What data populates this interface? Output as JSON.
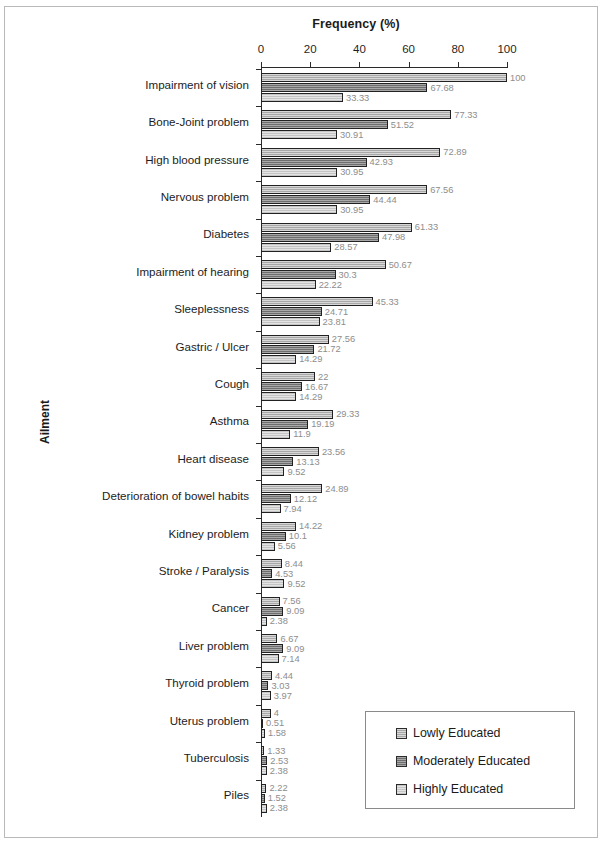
{
  "chart_data": {
    "type": "bar",
    "orientation": "horizontal",
    "title": "",
    "xlabel": "Frequency (%)",
    "ylabel": "Ailment",
    "xlim": [
      0,
      100
    ],
    "xticks": [
      0,
      20,
      40,
      60,
      80,
      100
    ],
    "grid": false,
    "legend_position": "bottom-right",
    "categories": [
      "Impairment  of vision",
      "Bone-Joint  problem",
      "High blood pressure",
      "Nervous problem",
      "Diabetes",
      "Impairment  of hearing",
      "Sleeplessness",
      "Gastric / Ulcer",
      "Cough",
      "Asthma",
      "Heart disease",
      "Deterioration of bowel habits",
      "Kidney problem",
      "Stroke / Paralysis",
      "Cancer",
      "Liver problem",
      "Thyroid problem",
      "Uterus problem",
      "Tuberculosis",
      "Piles"
    ],
    "series": [
      {
        "name": "Lowly Educated",
        "color": "#a8a8a8",
        "values": [
          100,
          77.33,
          72.89,
          67.56,
          61.33,
          50.67,
          45.33,
          27.56,
          22,
          29.33,
          23.56,
          24.89,
          14.22,
          8.44,
          7.56,
          6.67,
          4.44,
          4,
          1.33,
          2.22
        ],
        "labels": [
          "100",
          "77.33",
          "72.89",
          "67.56",
          "61.33",
          "50.67",
          "45.33",
          "27.56",
          "22",
          "29.33",
          "23.56",
          "24.89",
          "14.22",
          "8.44",
          "7.56",
          "6.67",
          "4.44",
          "4",
          "1.33",
          "2.22"
        ]
      },
      {
        "name": "Moderately Educated",
        "color": "#6e6e6e",
        "values": [
          67.68,
          51.52,
          42.93,
          44.44,
          47.98,
          30.3,
          24.71,
          21.72,
          16.67,
          19.19,
          13.13,
          12.12,
          10.1,
          4.53,
          9.09,
          9.09,
          3.03,
          0.51,
          2.53,
          1.52
        ],
        "labels": [
          "67.68",
          "51.52",
          "42.93",
          "44.44",
          "47.98",
          "30.3",
          "24.71",
          "21.72",
          "16.67",
          "19.19",
          "13.13",
          "12.12",
          "10.1",
          "4.53",
          "9.09",
          "9.09",
          "3.03",
          "0.51",
          "2.53",
          "1.52"
        ]
      },
      {
        "name": "Highly Educated",
        "color": "#e3e3e3",
        "values": [
          33.33,
          30.91,
          30.95,
          30.95,
          28.57,
          22.22,
          23.81,
          14.29,
          14.29,
          11.9,
          9.52,
          7.94,
          5.56,
          9.52,
          2.38,
          7.14,
          3.97,
          1.58,
          2.38,
          2.38
        ],
        "labels": [
          "33.33",
          "30.91",
          "30.95",
          "30.95",
          "28.57",
          "22.22",
          "23.81",
          "14.29",
          "14.29",
          "11.9",
          "9.52",
          "7.94",
          "5.56",
          "9.52",
          "2.38",
          "7.14",
          "3.97",
          "1.58",
          "2.38",
          "2.38"
        ]
      }
    ]
  },
  "legend": {
    "items": [
      {
        "label": "Lowly Educated",
        "color": "#a8a8a8"
      },
      {
        "label": "Moderately Educated",
        "color": "#6e6e6e"
      },
      {
        "label": "Highly Educated",
        "color": "#e3e3e3"
      }
    ]
  }
}
